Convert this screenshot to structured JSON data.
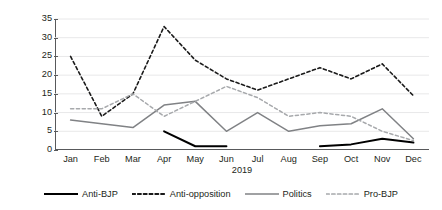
{
  "chart_data": {
    "type": "line",
    "title": "",
    "subtitle": "",
    "xlabel": "2019",
    "ylabel": "Number of debates per month",
    "categories": [
      "Jan",
      "Feb",
      "Mar",
      "Apr",
      "May",
      "Jun",
      "Jul",
      "Aug",
      "Sep",
      "Oct",
      "Nov",
      "Dec"
    ],
    "ylim": [
      0,
      35
    ],
    "yticks": [
      0,
      5,
      10,
      15,
      20,
      25,
      30,
      35
    ],
    "grid": true,
    "grid_axis": "y",
    "legend_position": "bottom",
    "series": [
      {
        "name": "Anti-BJP",
        "style": "solid",
        "color": "#000000",
        "width": 2.0,
        "values": [
          null,
          null,
          null,
          5,
          1,
          1,
          null,
          null,
          1,
          1.5,
          3,
          2
        ]
      },
      {
        "name": "Anti-opposition",
        "style": "dashed",
        "color": "#1a1a1a",
        "width": 1.6,
        "values": [
          25,
          9,
          15,
          33,
          24,
          19,
          16,
          19,
          22,
          19,
          23,
          14.5
        ]
      },
      {
        "name": "Politics",
        "style": "solid",
        "color": "#808285",
        "width": 1.5,
        "values": [
          8,
          7,
          6,
          12,
          13,
          5,
          10,
          5,
          6.5,
          7,
          11,
          3
        ]
      },
      {
        "name": "Pro-BJP",
        "style": "dashed",
        "color": "#a7a9ac",
        "width": 1.5,
        "values": [
          11,
          11,
          15,
          9,
          13,
          17,
          14,
          9,
          10,
          9,
          5,
          2.5
        ]
      }
    ]
  },
  "axis": {
    "y_title": "Number of debates per month",
    "y_tick_labels": [
      "0",
      "5",
      "10",
      "15",
      "20",
      "25",
      "30",
      "35"
    ],
    "x_tick_labels": [
      "Jan",
      "Feb",
      "Mar",
      "Apr",
      "May",
      "Jun",
      "Jul",
      "Aug",
      "Sep",
      "Oct",
      "Nov",
      "Dec"
    ],
    "x_axis_title": "2019"
  },
  "legend": {
    "items": [
      {
        "label": "Anti-BJP"
      },
      {
        "label": "Anti-opposition"
      },
      {
        "label": "Politics"
      },
      {
        "label": "Pro-BJP"
      }
    ]
  }
}
